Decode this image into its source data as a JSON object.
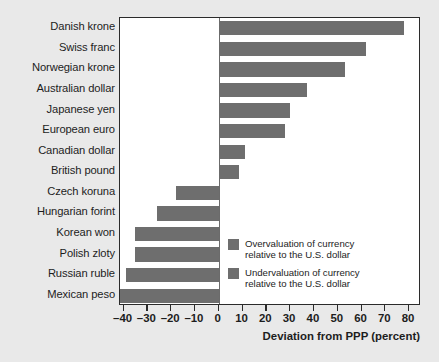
{
  "chart_data": {
    "type": "bar",
    "orientation": "horizontal",
    "title": "",
    "subtitle": "",
    "xlabel": "Deviation from PPP (percent)",
    "ylabel": "",
    "xlim": [
      -41.5,
      85
    ],
    "xticks": [
      -40,
      -30,
      -20,
      -10,
      0,
      10,
      20,
      30,
      40,
      50,
      60,
      70,
      80
    ],
    "xticklabels": [
      "–40",
      "–30",
      "–20",
      "–10",
      "0",
      "10",
      "20",
      "30",
      "40",
      "50",
      "60",
      "70",
      "80"
    ],
    "grid": false,
    "zero_reference_line": true,
    "categories": [
      "Danish krone",
      "Swiss franc",
      "Norwegian krone",
      "Australian dollar",
      "Japanese yen",
      "European euro",
      "Canadian dollar",
      "British pound",
      "Czech koruna",
      "Hungarian forint",
      "Korean won",
      "Polish zloty",
      "Russian ruble",
      "Mexican peso"
    ],
    "values": [
      78,
      62,
      53,
      37,
      30,
      28,
      11,
      8.5,
      -18,
      -26,
      -35,
      -35,
      -39,
      -41.5
    ],
    "series": [
      {
        "name": "Deviation from PPP (percent)",
        "values": [
          78,
          62,
          53,
          37,
          30,
          28,
          11,
          8.5,
          -18,
          -26,
          -35,
          -35,
          -39,
          -41.5
        ]
      }
    ],
    "bar_color": "#6e6e6e",
    "plot_background": "#ffffff",
    "figure_background": "#e9e9e9"
  },
  "legend": {
    "position": "inside-lower-right",
    "items": [
      {
        "swatch_color": "#6e6e6e",
        "line1": "Overvaluation of currency",
        "line2": "relative to the U.S. dollar"
      },
      {
        "swatch_color": "#6e6e6e",
        "line1": "Undervaluation of currency",
        "line2": "relative to the U.S. dollar"
      }
    ]
  }
}
